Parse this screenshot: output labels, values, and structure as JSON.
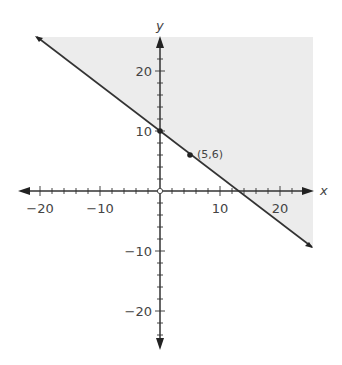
{
  "chart_data": {
    "type": "line",
    "title": "",
    "xlabel": "x",
    "ylabel": "y",
    "xlim": [
      -21,
      25.5
    ],
    "ylim": [
      -26,
      26
    ],
    "grid": false,
    "x_ticks": [
      -20,
      -10,
      10,
      20
    ],
    "y_ticks": [
      20,
      10,
      -10,
      -20
    ],
    "tick_labels_x": [
      "−20",
      "−10",
      "10",
      "20"
    ],
    "tick_labels_y": [
      "20",
      "10",
      "−10",
      "−20"
    ],
    "series": [
      {
        "name": "boundary line",
        "equation": "y = 10 - 0.8x",
        "style": "solid",
        "x": [
          -20.5,
          25.3
        ],
        "y": [
          26.4,
          -10.2
        ]
      }
    ],
    "shaded_region": "above the line (y >= 10 - 0.8x)",
    "shade_color": "#ececec",
    "points": [
      {
        "x": 0,
        "y": 10,
        "label": ""
      },
      {
        "x": 5,
        "y": 6,
        "label": "(5,6)"
      }
    ],
    "origin_marker": "open circle"
  }
}
